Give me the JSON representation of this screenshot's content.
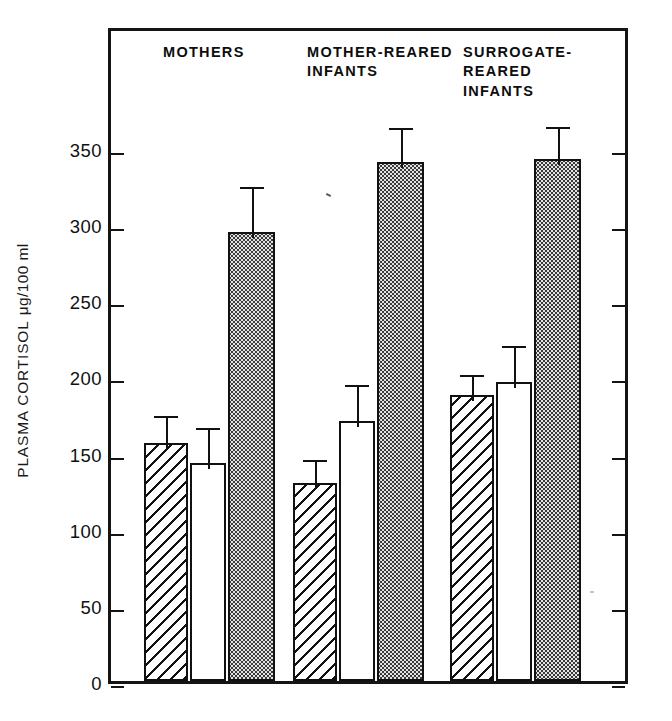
{
  "chart_data": {
    "type": "bar",
    "title": "",
    "xlabel": "",
    "ylabel": "PLASMA CORTISOL μg/100 ml",
    "ylabel_parts": {
      "text": "PLASMA CORTISOL",
      "unit": "μg/100 ml"
    },
    "ylim": [
      0,
      390
    ],
    "yticks": [
      0,
      50,
      100,
      150,
      200,
      250,
      300,
      350
    ],
    "ytick_labels": [
      "0",
      "50",
      "100",
      "150",
      "200",
      "250",
      "300",
      "350"
    ],
    "grid": false,
    "legend": "none",
    "axis_ticks": "both-sides",
    "categories": [
      "MOTHERS",
      "MOTHER-REARED\nINFANTS",
      "SURROGATE-\nREARED\nINFANTS"
    ],
    "category_labels": [
      "MOTHERS",
      "MOTHER-REARED INFANTS",
      "SURROGATE-REARED INFANTS"
    ],
    "series": [
      {
        "name": "hatched",
        "fill": "diagonal-hatch",
        "values": [
          156,
          130,
          188
        ],
        "errors": [
          22,
          19,
          17
        ]
      },
      {
        "name": "open",
        "fill": "white",
        "values": [
          143,
          171,
          196
        ],
        "errors": [
          27,
          27,
          28
        ]
      },
      {
        "name": "stippled",
        "fill": "stipple",
        "values": [
          295,
          341,
          343
        ],
        "errors": [
          33,
          26,
          25
        ]
      }
    ],
    "bars": [
      {
        "group": "MOTHERS",
        "series": "hatched",
        "value": 156,
        "error": 22,
        "error_top": 178
      },
      {
        "group": "MOTHERS",
        "series": "open",
        "value": 143,
        "error": 27,
        "error_top": 170
      },
      {
        "group": "MOTHERS",
        "series": "stippled",
        "value": 295,
        "error": 33,
        "error_top": 328
      },
      {
        "group": "MOTHER-REARED INFANTS",
        "series": "hatched",
        "value": 130,
        "error": 19,
        "error_top": 149
      },
      {
        "group": "MOTHER-REARED INFANTS",
        "series": "open",
        "value": 171,
        "error": 27,
        "error_top": 198
      },
      {
        "group": "MOTHER-REARED INFANTS",
        "series": "stippled",
        "value": 341,
        "error": 26,
        "error_top": 367
      },
      {
        "group": "SURROGATE-REARED INFANTS",
        "series": "hatched",
        "value": 188,
        "error": 17,
        "error_top": 205
      },
      {
        "group": "SURROGATE-REARED INFANTS",
        "series": "open",
        "value": 196,
        "error": 28,
        "error_top": 224
      },
      {
        "group": "SURROGATE-REARED INFANTS",
        "series": "stippled",
        "value": 343,
        "error": 25,
        "error_top": 368
      }
    ],
    "colors": {
      "axis": "#141414",
      "bar_outline": "#111111",
      "stipple_fill": "#e2e2e2",
      "background": "#ffffff"
    }
  },
  "groups": [
    {
      "label": "MOTHERS"
    },
    {
      "label": "MOTHER-REARED\nINFANTS"
    },
    {
      "label": "SURROGATE-\nREARED\nINFANTS"
    }
  ]
}
